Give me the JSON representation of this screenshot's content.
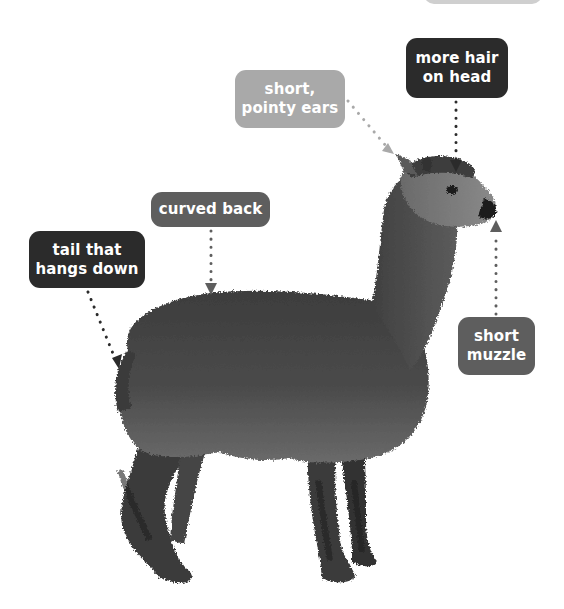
{
  "diagram": {
    "colors": {
      "dark_label": "#2b2b2b",
      "mid_label": "#5e5e5e",
      "light_label": "#a9a9a9",
      "top_partial_label": "#cfcfcf",
      "fur_dark": "#3a3a3a",
      "fur_mid": "#5a5a5a",
      "fur_light": "#7a7a7a"
    },
    "labels": [
      {
        "id": "more-hair-on-head",
        "lines": [
          "more hair",
          "on head"
        ],
        "style": "dark",
        "pointer": "down"
      },
      {
        "id": "short-pointy-ears",
        "lines": [
          "short,",
          "pointy ears"
        ],
        "style": "light",
        "pointer": "diagonal"
      },
      {
        "id": "curved-back",
        "lines": [
          "curved back"
        ],
        "style": "mid",
        "pointer": "down"
      },
      {
        "id": "tail-that-hangs-down",
        "lines": [
          "tail that",
          "hangs down"
        ],
        "style": "dark",
        "pointer": "diagonal"
      },
      {
        "id": "short-muzzle",
        "lines": [
          "short",
          "muzzle"
        ],
        "style": "mid",
        "pointer": "up"
      }
    ]
  }
}
